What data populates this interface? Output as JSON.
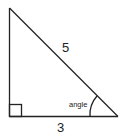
{
  "diagram": {
    "type": "right-triangle",
    "labels": {
      "hypotenuse": "5",
      "base": "3",
      "angle": "angle"
    },
    "colors": {
      "stroke": "#222222",
      "background": "#ffffff"
    }
  }
}
